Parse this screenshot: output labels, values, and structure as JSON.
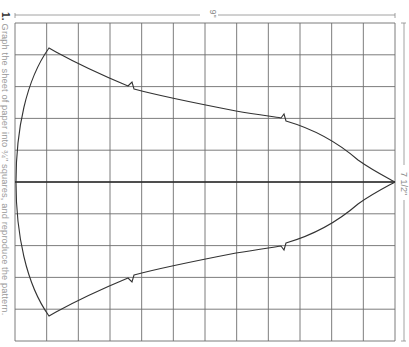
{
  "instruction": {
    "number": "1.",
    "text": "Graph the sheet of paper into ¾\" squares, and reproduce the pattern."
  },
  "dimensions": {
    "width_label": "9\"",
    "height_label": "7 1/2\""
  },
  "grid": {
    "columns": 12,
    "rows": 10,
    "square_size": "¾\"",
    "line_color": "#6e6e6e",
    "curve_color": "#333333"
  },
  "pattern": {
    "description": "Symmetric leaf/fish-like outline mirrored about a horizontal center line, with a small notch on each side at two points along the upper and lower curves, converging to a point at the right edge."
  }
}
